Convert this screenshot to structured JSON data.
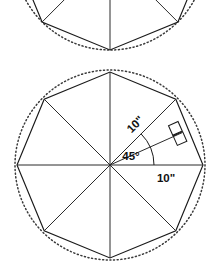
{
  "figure": {
    "background_color": "#ffffff",
    "stroke_color": "#1a1a1a",
    "dotted_circle_color": "#3a3a3a",
    "labels": {
      "radius_label": "10\"",
      "side_or_horizontal_label": "10\"",
      "central_angle_label": "45°"
    },
    "markers": {
      "right_angle": "right-angle-square",
      "central_angle_arc": "45-degree-arc"
    }
  },
  "top_figure": {
    "description": "Lower portion of a second, cropped octagon figure",
    "center": {
      "x": 110,
      "y": -46
    },
    "radius": 96,
    "vertices": [
      {
        "x": 42.1,
        "y": 22.0
      },
      {
        "x": 110.0,
        "y": 50.0
      },
      {
        "x": 177.9,
        "y": 22.0
      },
      {
        "x": 206.0,
        "y": -46.0
      },
      {
        "x": 14.0,
        "y": -46.0
      }
    ],
    "radii_endpoints": [
      {
        "x": 42.1,
        "y": 22.0
      },
      {
        "x": 110.0,
        "y": 50.0
      },
      {
        "x": 177.9,
        "y": 22.0
      }
    ],
    "dotted_arc": true
  },
  "main_figure": {
    "description": "Regular octagon with eight radii, inscribed in a dotted circle",
    "center": {
      "x": 110,
      "y": 165
    },
    "circumradius_px": 93,
    "sides": 8,
    "vertices": [
      {
        "x": 203.0,
        "y": 165.0,
        "angle_deg": 0
      },
      {
        "x": 175.8,
        "y": 99.2,
        "angle_deg": 45
      },
      {
        "x": 110.0,
        "y": 72.0,
        "angle_deg": 90
      },
      {
        "x": 44.2,
        "y": 99.2,
        "angle_deg": 135
      },
      {
        "x": 17.0,
        "y": 165.0,
        "angle_deg": 180
      },
      {
        "x": 44.2,
        "y": 230.8,
        "angle_deg": 225
      },
      {
        "x": 110.0,
        "y": 258.0,
        "angle_deg": 270
      },
      {
        "x": 175.8,
        "y": 230.8,
        "angle_deg": 315
      }
    ],
    "dotted_circle": {
      "cx": 110,
      "cy": 165,
      "r": 95
    },
    "annotations": [
      {
        "name": "radius-dimension",
        "text": "10\"",
        "x": 138,
        "y": 126,
        "rotation_deg": -45,
        "refers_to": "radius from center to upper-right vertex"
      },
      {
        "name": "central-angle",
        "text": "45°",
        "x": 129,
        "y": 156,
        "rotation_deg": 0,
        "refers_to": "angle between horizontal radius and upper-right radius"
      },
      {
        "name": "horizontal-dimension",
        "text": "10\"",
        "x": 158,
        "y": 180,
        "rotation_deg": 0,
        "refers_to": "radius from center to right vertex"
      }
    ],
    "apothem_ray": {
      "from": {
        "x": 110,
        "y": 165
      },
      "to": {
        "x": 181,
        "y": 134
      },
      "right_angle_at": {
        "x": 173,
        "y": 128
      }
    },
    "angle_arc": {
      "cx": 110,
      "cy": 165,
      "radius_px": 44,
      "start_angle_deg": 0,
      "end_angle_deg": 45
    }
  }
}
